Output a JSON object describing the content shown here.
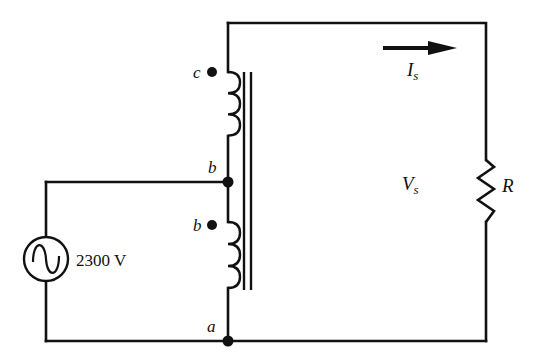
{
  "diagram": {
    "type": "autotransformer-circuit",
    "source": {
      "label": "2300 V",
      "icon": "ac-source-icon"
    },
    "nodes": {
      "top": "c",
      "middle": "b",
      "bottom": "a"
    },
    "dot_labels": {
      "upper_winding": "c",
      "lower_winding": "b"
    },
    "current": {
      "label": "I",
      "subscript": "s"
    },
    "voltage": {
      "label": "V",
      "subscript": "s"
    },
    "load": {
      "label": "R"
    },
    "colors": {
      "ink": "#111111",
      "background": "#ffffff"
    }
  }
}
